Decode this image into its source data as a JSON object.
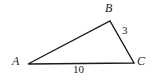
{
  "figure": {
    "kind": "triangle-diagram",
    "background_color": "#ffffff",
    "stroke_color": "#1c1c1c",
    "stroke_width": 1.4,
    "width": 158,
    "height": 80
  },
  "vertices": {
    "a": {
      "label": "A",
      "x": 28,
      "y": 64
    },
    "b": {
      "label": "B",
      "x": 110,
      "y": 21
    },
    "c": {
      "label": "C",
      "x": 134,
      "y": 63
    }
  },
  "sides": {
    "bc": {
      "label": "3",
      "from": "B",
      "to": "C"
    },
    "ac": {
      "label": "10",
      "from": "A",
      "to": "C"
    },
    "ab": {
      "label": "",
      "from": "A",
      "to": "B"
    }
  },
  "chart_data": {
    "type": "diagram",
    "title": "",
    "shape": "triangle",
    "points": [
      {
        "name": "A",
        "x": 28,
        "y": 64
      },
      {
        "name": "B",
        "x": 110,
        "y": 21
      },
      {
        "name": "C",
        "x": 134,
        "y": 63
      }
    ],
    "edges": [
      {
        "from": "A",
        "to": "B",
        "label": ""
      },
      {
        "from": "B",
        "to": "C",
        "label": "3"
      },
      {
        "from": "A",
        "to": "C",
        "label": "10"
      }
    ],
    "annotations": [
      "A",
      "B",
      "C",
      "3",
      "10"
    ]
  }
}
